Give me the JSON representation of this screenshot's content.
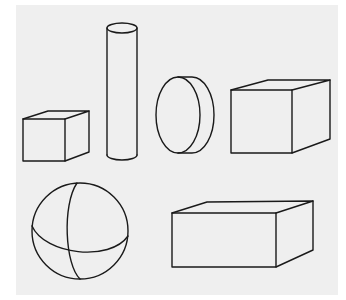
{
  "figure": {
    "background_color": "#efefef",
    "stroke_color": "#1a1a1a",
    "shapes": [
      {
        "name": "small cube",
        "type": "cube"
      },
      {
        "name": "tall cylinder",
        "type": "cylinder"
      },
      {
        "name": "disk",
        "type": "disk"
      },
      {
        "name": "large cube",
        "type": "cube"
      },
      {
        "name": "sphere",
        "type": "sphere"
      },
      {
        "name": "rectangular box",
        "type": "cuboid"
      }
    ]
  }
}
